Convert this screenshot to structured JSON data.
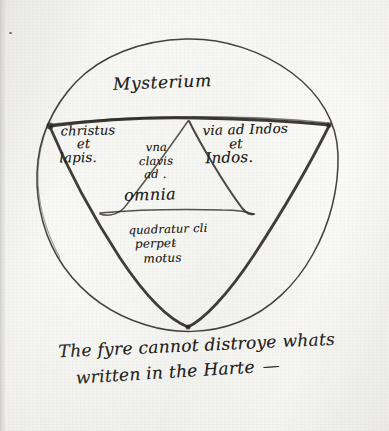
{
  "document": {
    "kind": "manuscript-diagram",
    "title_text": "Mysterium",
    "ink_color": "#242220",
    "paper_color": "#f7f7f5"
  },
  "diagram": {
    "shapes": {
      "outer_circle": "hand-drawn-circle",
      "inner_triangle": "inscribed-downward-triangle",
      "central_triangle": "inverted-inner-triangle"
    },
    "top_label": "Mysterium",
    "left_section": {
      "line1": "christus",
      "line2": "et",
      "line3": "lapis."
    },
    "right_section": {
      "line1": "via ad Indos",
      "line2": "et",
      "line3": "Indos."
    },
    "center_section": {
      "line1": "vna",
      "line2": "clavis",
      "line3": "ad .",
      "emphasis": "omnia"
    },
    "bottom_section": {
      "line1": "quadratur cli",
      "line2": "perpet̵",
      "line3": "motus"
    }
  },
  "motto": {
    "line1": "The fyre cannot distroye whats",
    "line2": "written in the Harte",
    "dash": "—"
  }
}
